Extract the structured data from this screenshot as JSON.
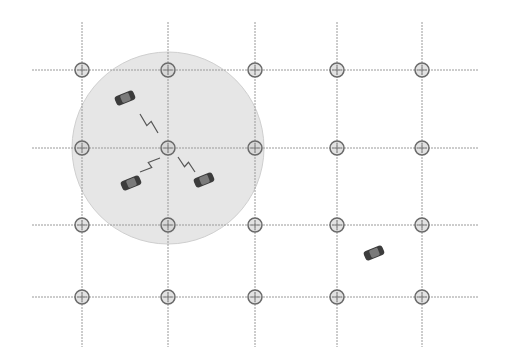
{
  "diagram": {
    "type": "grid-network",
    "grid": {
      "columns_x": [
        82,
        168,
        255,
        337,
        422
      ],
      "rows_y": [
        70,
        148,
        225,
        297
      ],
      "x_extent": [
        32,
        478
      ],
      "y_extent": [
        22,
        347
      ],
      "line_color": "#9a9a9a"
    },
    "coverage": {
      "center": [
        168,
        148
      ],
      "radius": 96,
      "fill": "#e6e6e6",
      "stroke": "#cfcfcf"
    },
    "node_style": {
      "radius": 7,
      "stroke": "#6a6a6a",
      "fill": "#cfcfcf"
    },
    "vehicles": [
      {
        "id": "car-1",
        "x": 125,
        "y": 98,
        "angle": -22,
        "in_range": true
      },
      {
        "id": "car-2",
        "x": 131,
        "y": 183,
        "angle": -22,
        "in_range": true
      },
      {
        "id": "car-3",
        "x": 204,
        "y": 180,
        "angle": -22,
        "in_range": true
      },
      {
        "id": "car-4",
        "x": 374,
        "y": 253,
        "angle": -22,
        "in_range": false
      }
    ],
    "links": [
      {
        "from": [
          140,
          114
        ],
        "to": [
          158,
          133
        ]
      },
      {
        "from": [
          140,
          172
        ],
        "to": [
          160,
          158
        ]
      },
      {
        "from": [
          178,
          157
        ],
        "to": [
          195,
          172
        ]
      }
    ],
    "colors": {
      "car": "#3c3c3c",
      "link": "#555555"
    }
  }
}
